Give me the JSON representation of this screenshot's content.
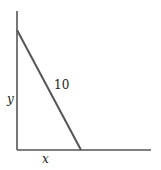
{
  "diagram": {
    "type": "ladder-against-wall",
    "labels": {
      "vertical": "y",
      "horizontal": "x",
      "hypotenuse": "10"
    },
    "colors": {
      "axes": "#555555",
      "ladder": "#555555",
      "text": "#222222"
    }
  }
}
